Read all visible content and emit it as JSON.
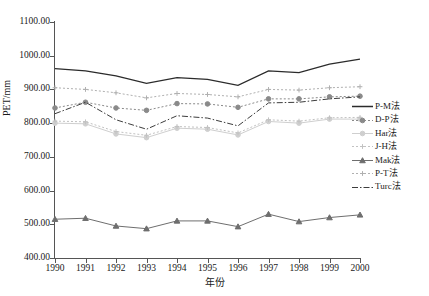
{
  "chart_data": {
    "type": "line",
    "title": "",
    "xlabel": "年份",
    "ylabel": "PET/mm",
    "x": [
      1990,
      1991,
      1992,
      1993,
      1994,
      1995,
      1996,
      1997,
      1998,
      1999,
      2000
    ],
    "xticklabels": [
      "1990",
      "1991",
      "1992",
      "1993",
      "1994",
      "1995",
      "1996",
      "1997",
      "1998",
      "1999",
      "2000"
    ],
    "yticklabels": [
      "1100.00",
      "1000.00",
      "900.00",
      "800.00",
      "700.00",
      "600.00",
      "500.00",
      "400.00"
    ],
    "yticks": [
      1100,
      1000,
      900,
      800,
      700,
      600,
      500,
      400
    ],
    "ylim": [
      400,
      1100
    ],
    "xlim": [
      1990,
      2000
    ],
    "grid": false,
    "legend_position": "right",
    "series": [
      {
        "name": "P-M法",
        "style": "solid",
        "color": "#2b2b2b",
        "marker": "none",
        "values": [
          962,
          955,
          940,
          918,
          935,
          930,
          912,
          955,
          950,
          975,
          990
        ]
      },
      {
        "name": "D-P法",
        "style": "dotted",
        "color": "#8a8a8a",
        "marker": "circle",
        "values": [
          845,
          862,
          845,
          838,
          858,
          857,
          847,
          872,
          872,
          878,
          880
        ]
      },
      {
        "name": "Har法",
        "style": "solid",
        "color": "#cfcfcf",
        "marker": "circle",
        "values": [
          800,
          798,
          768,
          757,
          785,
          782,
          765,
          805,
          800,
          812,
          812
        ]
      },
      {
        "name": "J-H法",
        "style": "dotted",
        "color": "#c2c2c2",
        "marker": "plus",
        "values": [
          806,
          804,
          775,
          764,
          790,
          787,
          771,
          810,
          806,
          816,
          817
        ]
      },
      {
        "name": "Mak法",
        "style": "solid",
        "color": "#6e6e6e",
        "marker": "triangle",
        "values": [
          515,
          518,
          495,
          487,
          510,
          510,
          493,
          530,
          508,
          520,
          528
        ]
      },
      {
        "name": "P-T法",
        "style": "dotted",
        "color": "#b0b0b0",
        "marker": "plus",
        "values": [
          905,
          900,
          890,
          875,
          888,
          885,
          878,
          900,
          898,
          905,
          908
        ]
      },
      {
        "name": "Turc法",
        "style": "dashdot",
        "color": "#3d3d3d",
        "marker": "none",
        "values": [
          828,
          862,
          810,
          782,
          822,
          815,
          792,
          860,
          862,
          872,
          878
        ]
      }
    ]
  },
  "legend": {
    "items": [
      {
        "label": "P-M法"
      },
      {
        "label": "D-P法"
      },
      {
        "label": "Har法"
      },
      {
        "label": "J-H法"
      },
      {
        "label": "Mak法"
      },
      {
        "label": "P-T法"
      },
      {
        "label": "Turc法"
      }
    ]
  }
}
